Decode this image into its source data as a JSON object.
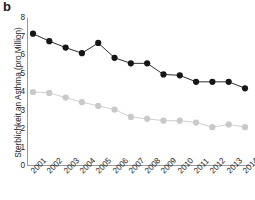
{
  "panel": {
    "label": "b"
  },
  "axes": {
    "ylabel": "Sterblichkeit an Asthma (pro Million)",
    "xlabel": "",
    "yticks": [
      "8",
      "7",
      "6",
      "5",
      "4",
      "3",
      "2",
      "1",
      "0"
    ],
    "xticks": [
      "2001",
      "2002",
      "2003",
      "2004",
      "2005",
      "2006",
      "2007",
      "2008",
      "2009",
      "2010",
      "2011",
      "2012",
      "2013",
      "2014"
    ]
  },
  "colors": {
    "series_dark": "#161616",
    "series_light": "#c9c9c9",
    "axis": "#9a9a9a",
    "text": "#222222",
    "background": "#ffffff"
  },
  "chart_data": {
    "type": "line",
    "title": "",
    "xlabel": "",
    "ylabel": "Sterblichkeit an Asthma (pro Million)",
    "categories": [
      "2001",
      "2002",
      "2003",
      "2004",
      "2005",
      "2006",
      "2007",
      "2008",
      "2009",
      "2010",
      "2011",
      "2012",
      "2013",
      "2014"
    ],
    "ylim": [
      0,
      8
    ],
    "ytick_values": [
      0,
      1,
      2,
      3,
      4,
      5,
      6,
      7,
      8
    ],
    "grid": false,
    "legend": "none",
    "series": [
      {
        "name": "dark-series",
        "color": "#161616",
        "marker": "circle",
        "values": [
          7.15,
          6.75,
          6.4,
          6.1,
          6.65,
          5.85,
          5.55,
          5.55,
          4.95,
          4.9,
          4.55,
          4.55,
          4.55,
          4.2
        ]
      },
      {
        "name": "light-series",
        "color": "#c9c9c9",
        "marker": "circle",
        "values": [
          4.0,
          3.95,
          3.7,
          3.45,
          3.25,
          3.05,
          2.65,
          2.55,
          2.45,
          2.45,
          2.35,
          2.1,
          2.25,
          2.1
        ]
      }
    ]
  }
}
